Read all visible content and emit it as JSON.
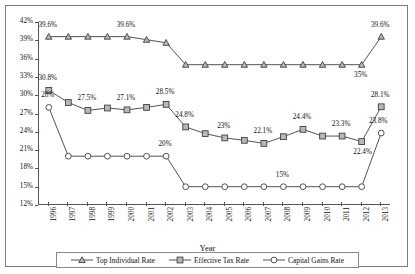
{
  "chart_data": {
    "type": "line",
    "title": "",
    "xlabel": "Year",
    "ylabel": "",
    "grid": false,
    "legend_position": "bottom",
    "ylim": [
      12,
      42
    ],
    "ytick_step": 3,
    "ytick_labels": [
      "42%",
      "39%",
      "36%",
      "33%",
      "30%",
      "27%",
      "24%",
      "21%",
      "18%",
      "15%",
      "12%"
    ],
    "ytick_values": [
      42,
      39,
      36,
      33,
      30,
      27,
      24,
      21,
      18,
      15,
      12
    ],
    "categories": [
      "1996",
      "1997",
      "1998",
      "1999",
      "2000",
      "2001",
      "2002",
      "2003",
      "2004",
      "2005",
      "2006",
      "2007",
      "2008",
      "2009",
      "2010",
      "2011",
      "2012",
      "2013"
    ],
    "series": [
      {
        "name": "Top Individual Rate",
        "marker": "triangle",
        "values": [
          39.6,
          39.6,
          39.6,
          39.6,
          39.6,
          39.1,
          38.6,
          35,
          35,
          35,
          35,
          35,
          35,
          35,
          35,
          35,
          35,
          39.6
        ],
        "labels": [
          {
            "index": 0,
            "text": "39.6%",
            "dx": 0,
            "dy": -11
          },
          {
            "index": 4,
            "text": "39.6%",
            "dx": 0,
            "dy": -11
          },
          {
            "index": 16,
            "text": "35%",
            "dx": 0,
            "dy": 11
          },
          {
            "index": 17,
            "text": "39.6%",
            "dx": 0,
            "dy": -11
          }
        ]
      },
      {
        "name": "Effective Tax Rate",
        "marker": "square",
        "values": [
          30.8,
          28.8,
          27.5,
          27.9,
          27.6,
          28.0,
          28.5,
          24.8,
          23.7,
          23.0,
          22.6,
          22.1,
          23.2,
          24.4,
          23.3,
          23.3,
          22.4,
          28.1
        ],
        "labels": [
          {
            "index": 0,
            "text": "30.8%",
            "dx": 0,
            "dy": -11
          },
          {
            "index": 2,
            "text": "27.5%",
            "dx": 0,
            "dy": -11
          },
          {
            "index": 4,
            "text": "27.1%",
            "dx": 0,
            "dy": -11
          },
          {
            "index": 6,
            "text": "28.5%",
            "dx": 0,
            "dy": -11
          },
          {
            "index": 7,
            "text": "24.8%",
            "dx": 0,
            "dy": -11
          },
          {
            "index": 9,
            "text": "23%",
            "dx": 0,
            "dy": -11
          },
          {
            "index": 11,
            "text": "22.1%",
            "dx": 0,
            "dy": -11
          },
          {
            "index": 13,
            "text": "24.4%",
            "dx": 0,
            "dy": -11
          },
          {
            "index": 15,
            "text": "23.3%",
            "dx": 0,
            "dy": -11
          },
          {
            "index": 16,
            "text": "22.4%",
            "dx": 2,
            "dy": 11
          },
          {
            "index": 17,
            "text": "28.1%",
            "dx": 0,
            "dy": -11
          }
        ]
      },
      {
        "name": "Capital Gains Rate",
        "marker": "circle",
        "values": [
          28,
          20,
          20,
          20,
          20,
          20,
          20,
          15,
          15,
          15,
          15,
          15,
          15,
          15,
          15,
          15,
          15,
          23.8
        ],
        "labels": [
          {
            "index": 0,
            "text": "28%",
            "dx": 0,
            "dy": -11
          },
          {
            "index": 6,
            "text": "20%",
            "dx": 0,
            "dy": -11
          },
          {
            "index": 12,
            "text": "15%",
            "dx": 0,
            "dy": -11
          },
          {
            "index": 17,
            "text": "23.8%",
            "dx": -2,
            "dy": -11
          }
        ]
      }
    ],
    "colors": {
      "line": "#404040",
      "marker_fill_triangle": "#b8b8b8",
      "marker_fill_square": "#b8b8b8",
      "marker_fill_circle": "#ffffff",
      "axis": "#555555",
      "text": "#111111",
      "frame": "#7d7d7d"
    }
  },
  "legend": {
    "items": [
      {
        "label": "Top Individual Rate",
        "marker": "triangle"
      },
      {
        "label": "Effective Tax Rate",
        "marker": "square"
      },
      {
        "label": "Capital Gains Rate",
        "marker": "circle"
      }
    ]
  }
}
